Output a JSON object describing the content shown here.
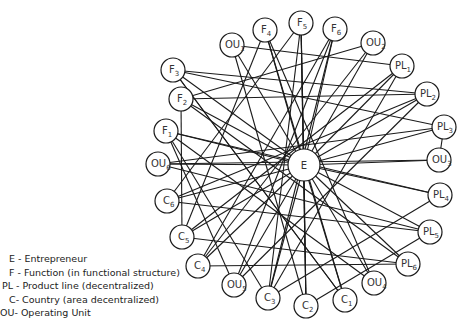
{
  "diagram": {
    "center": {
      "id": "E",
      "label": "E",
      "x": 304,
      "y": 165,
      "r": 16
    },
    "nodes": [
      {
        "id": "F3",
        "base": "F",
        "sub": "3",
        "x": 173,
        "y": 70
      },
      {
        "id": "OU1",
        "base": "OU",
        "sub": "1",
        "x": 232,
        "y": 45
      },
      {
        "id": "F4",
        "base": "F",
        "sub": "4",
        "x": 265,
        "y": 30
      },
      {
        "id": "F5",
        "base": "F",
        "sub": "5",
        "x": 301,
        "y": 23
      },
      {
        "id": "F6",
        "base": "F",
        "sub": "6",
        "x": 335,
        "y": 29
      },
      {
        "id": "OU2",
        "base": "OU",
        "sub": "2",
        "x": 373,
        "y": 43
      },
      {
        "id": "PL1",
        "base": "PL",
        "sub": "1",
        "x": 402,
        "y": 66
      },
      {
        "id": "PL2",
        "base": "PL",
        "sub": "2",
        "x": 427,
        "y": 94
      },
      {
        "id": "PL3",
        "base": "PL",
        "sub": "3",
        "x": 444,
        "y": 127
      },
      {
        "id": "OU3",
        "base": "OU",
        "sub": "3",
        "x": 439,
        "y": 160
      },
      {
        "id": "PL4",
        "base": "PL",
        "sub": "4",
        "x": 440,
        "y": 195
      },
      {
        "id": "PL5",
        "base": "PL",
        "sub": "5",
        "x": 430,
        "y": 232
      },
      {
        "id": "PL6",
        "base": "PL",
        "sub": "6",
        "x": 408,
        "y": 264
      },
      {
        "id": "OU4",
        "base": "OU",
        "sub": "4",
        "x": 374,
        "y": 283
      },
      {
        "id": "C1",
        "base": "C",
        "sub": "1",
        "x": 345,
        "y": 300
      },
      {
        "id": "C2",
        "base": "C",
        "sub": "2",
        "x": 306,
        "y": 306
      },
      {
        "id": "C3",
        "base": "C",
        "sub": "3",
        "x": 268,
        "y": 298
      },
      {
        "id": "OU5",
        "base": "OU",
        "sub": "5",
        "x": 234,
        "y": 285
      },
      {
        "id": "C4",
        "base": "C",
        "sub": "4",
        "x": 198,
        "y": 266
      },
      {
        "id": "C5",
        "base": "C",
        "sub": "5",
        "x": 182,
        "y": 237
      },
      {
        "id": "C6",
        "base": "C",
        "sub": "6",
        "x": 167,
        "y": 201
      },
      {
        "id": "OU6",
        "base": "OU",
        "sub": "6",
        "x": 158,
        "y": 164
      },
      {
        "id": "F1",
        "base": "F",
        "sub": "1",
        "x": 166,
        "y": 131
      },
      {
        "id": "F2",
        "base": "F",
        "sub": "2",
        "x": 181,
        "y": 99
      }
    ],
    "edges": [
      [
        "E",
        "F1"
      ],
      [
        "E",
        "F2"
      ],
      [
        "E",
        "F3"
      ],
      [
        "E",
        "F4"
      ],
      [
        "E",
        "F5"
      ],
      [
        "E",
        "F6"
      ],
      [
        "E",
        "OU1"
      ],
      [
        "E",
        "OU2"
      ],
      [
        "E",
        "OU3"
      ],
      [
        "E",
        "OU4"
      ],
      [
        "E",
        "OU5"
      ],
      [
        "E",
        "OU6"
      ],
      [
        "E",
        "PL1"
      ],
      [
        "E",
        "PL2"
      ],
      [
        "E",
        "PL3"
      ],
      [
        "E",
        "PL4"
      ],
      [
        "E",
        "PL5"
      ],
      [
        "E",
        "PL6"
      ],
      [
        "E",
        "C1"
      ],
      [
        "E",
        "C2"
      ],
      [
        "E",
        "C3"
      ],
      [
        "E",
        "C4"
      ],
      [
        "E",
        "C5"
      ],
      [
        "E",
        "C6"
      ],
      [
        "F3",
        "PL2"
      ],
      [
        "F3",
        "PL3"
      ],
      [
        "F3",
        "C1"
      ],
      [
        "F2",
        "PL2"
      ],
      [
        "F2",
        "OU2"
      ],
      [
        "F1",
        "PL4"
      ],
      [
        "F1",
        "C3"
      ],
      [
        "OU6",
        "OU3"
      ],
      [
        "OU6",
        "PL5"
      ],
      [
        "C6",
        "PL5"
      ],
      [
        "C6",
        "F5"
      ],
      [
        "C5",
        "PL6"
      ],
      [
        "C5",
        "F4"
      ],
      [
        "C4",
        "PL6"
      ],
      [
        "C4",
        "F6"
      ],
      [
        "OU1",
        "PL1"
      ],
      [
        "OU1",
        "C2"
      ],
      [
        "F4",
        "C1"
      ],
      [
        "F4",
        "OU4"
      ],
      [
        "F5",
        "C2"
      ],
      [
        "F5",
        "C3"
      ],
      [
        "F6",
        "C3"
      ],
      [
        "F6",
        "OU5"
      ],
      [
        "OU2",
        "C4"
      ],
      [
        "PL1",
        "C5"
      ],
      [
        "PL2",
        "C6"
      ],
      [
        "PL3",
        "OU6"
      ],
      [
        "PL3",
        "OU3"
      ],
      [
        "PL4",
        "C3"
      ],
      [
        "PL5",
        "C2"
      ],
      [
        "PL6",
        "F2"
      ],
      [
        "OU4",
        "F1"
      ],
      [
        "C1",
        "F3"
      ],
      [
        "C2",
        "F5"
      ],
      [
        "OU5",
        "PL2"
      ],
      [
        "C3",
        "PL1"
      ],
      [
        "F1",
        "OU5"
      ],
      [
        "F2",
        "C5"
      ]
    ]
  },
  "legend": [
    {
      "abbr": "E",
      "text": "E - Entrepreneur"
    },
    {
      "abbr": "F",
      "text": "F - Function (in functional structure)"
    },
    {
      "abbr": "PL",
      "text": "PL - Product line (decentralized)"
    },
    {
      "abbr": "C",
      "text": "C- Country (area decentralized)"
    },
    {
      "abbr": "OU",
      "text": "OU- Operating Unit"
    }
  ],
  "colors": {
    "line": "#1a1a1a",
    "node_fill": "#ffffff",
    "text": "#333333"
  }
}
